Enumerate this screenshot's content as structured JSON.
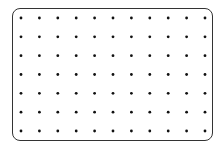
{
  "grid": {
    "columns": 11,
    "rows": 7,
    "dot_color": "#111111",
    "border_color": "#333333"
  }
}
